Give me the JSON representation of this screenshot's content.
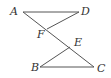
{
  "diagram": {
    "points": {
      "A": {
        "label": "A",
        "x": 23,
        "y": 12,
        "lx": 10,
        "ly": 15
      },
      "D": {
        "label": "D",
        "x": 79,
        "y": 12,
        "lx": 81,
        "ly": 15
      },
      "F": {
        "label": "F",
        "x": 47,
        "y": 29,
        "lx": 37,
        "ly": 38
      },
      "E": {
        "label": "E",
        "x": 70,
        "y": 47,
        "lx": 74,
        "ly": 46
      },
      "B": {
        "label": "B",
        "x": 40,
        "y": 67,
        "lx": 31,
        "ly": 71
      },
      "C": {
        "label": "C",
        "x": 94,
        "y": 67,
        "lx": 97,
        "ly": 72
      }
    },
    "segments": [
      {
        "from": "A",
        "to": "D"
      },
      {
        "from": "D",
        "to": "F"
      },
      {
        "from": "A",
        "to": "C"
      },
      {
        "from": "B",
        "to": "E"
      },
      {
        "from": "B",
        "to": "C"
      }
    ],
    "line_color": "#555555",
    "label_color": "#333333"
  }
}
